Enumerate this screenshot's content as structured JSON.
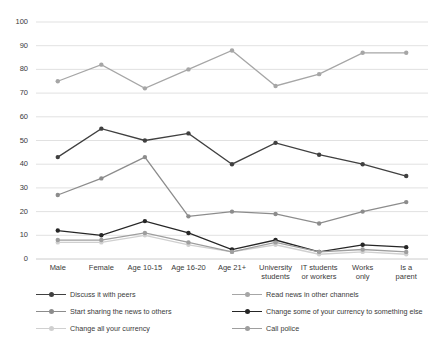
{
  "chart_data": {
    "type": "line",
    "title": "",
    "xlabel": "",
    "ylabel": "",
    "ylim": [
      0,
      100
    ],
    "yticks": [
      0,
      10,
      20,
      30,
      40,
      50,
      60,
      70,
      80,
      90,
      100
    ],
    "grid": true,
    "legend_position": "bottom",
    "categories": [
      "Male",
      "Female",
      "Age 10-15",
      "Age 16-20",
      "Age 21+",
      "University students",
      "IT students or workers",
      "Works only",
      "Is a parent"
    ],
    "series": [
      {
        "name": "Discuss it with peers",
        "color": "#404040",
        "values": [
          43,
          55,
          50,
          53,
          40,
          49,
          44,
          40,
          35
        ]
      },
      {
        "name": "Read news in other channels",
        "color": "#a6a6a6",
        "values": [
          75,
          82,
          72,
          80,
          88,
          73,
          78,
          87,
          87
        ]
      },
      {
        "name": "Start sharing the news to others",
        "color": "#8c8c8c",
        "values": [
          27,
          34,
          43,
          18,
          20,
          19,
          15,
          20,
          24
        ]
      },
      {
        "name": "Change some of your currency to something else",
        "color": "#262626",
        "values": [
          12,
          10,
          16,
          11,
          4,
          8,
          3,
          6,
          5
        ]
      },
      {
        "name": "Change all your currency",
        "color": "#d0d0d0",
        "values": [
          7,
          7,
          10,
          6,
          3,
          6,
          2,
          3,
          2
        ]
      },
      {
        "name": "Call police",
        "color": "#9e9e9e",
        "values": [
          8,
          8,
          11,
          7,
          3,
          7,
          3,
          4,
          3
        ]
      }
    ]
  },
  "legend": {
    "items": [
      {
        "label": "Discuss it with peers"
      },
      {
        "label": "Read news in other channels"
      },
      {
        "label": "Start sharing the news to others"
      },
      {
        "label": "Change some of your currency to something else"
      },
      {
        "label": "Change all your currency"
      },
      {
        "label": "Call police"
      }
    ]
  }
}
